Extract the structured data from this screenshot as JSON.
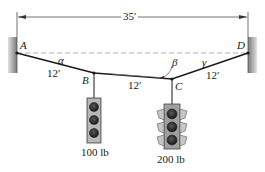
{
  "figure": {
    "span_dimension": "35′",
    "points": {
      "A": "A",
      "B": "B",
      "C": "C",
      "D": "D"
    },
    "angles": {
      "alpha": "α",
      "beta": "β",
      "gamma": "γ"
    },
    "segment_lengths": {
      "AB": "12′",
      "BC": "12′",
      "CD": "12′"
    },
    "loads": {
      "B": {
        "label": "100 lb",
        "type": "traffic-signal-3-light"
      },
      "C": {
        "label": "200 lb",
        "type": "traffic-signal-3-light-with-visors"
      }
    }
  },
  "colors": {
    "ink": "#1a1a1a",
    "wall_fill": "#8a8a8a",
    "dashed_reference": "#9a9a9a",
    "signal_body_light": "#9a9a9a",
    "signal_lamp": "#2a2a2a"
  }
}
